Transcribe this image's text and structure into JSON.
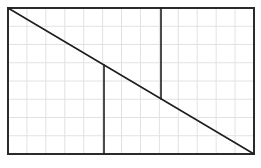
{
  "diagram": {
    "type": "geometric-figure",
    "canvas": {
      "width": 261,
      "height": 168,
      "background": "#ffffff"
    },
    "grid": {
      "x0": 8,
      "y0": 8,
      "x1": 254,
      "y1": 154,
      "columns": 13,
      "rows": 8,
      "color": "#e2e2e2"
    },
    "rectangle": {
      "x": 8,
      "y": 8,
      "width": 246,
      "height": 146,
      "stroke": "#2b2b2b",
      "stroke_width": 2
    },
    "segments": [
      {
        "name": "diagonal",
        "x1": 8,
        "y1": 8,
        "x2": 254,
        "y2": 154,
        "stroke": "#1e1e1e",
        "stroke_width": 1.6
      },
      {
        "name": "left-vertical",
        "x1": 104,
        "y1": 65,
        "x2": 104,
        "y2": 154,
        "stroke": "#1e1e1e",
        "stroke_width": 1.6
      },
      {
        "name": "right-vertical",
        "x1": 161,
        "y1": 8,
        "x2": 161,
        "y2": 99,
        "stroke": "#1e1e1e",
        "stroke_width": 1.6
      }
    ]
  }
}
